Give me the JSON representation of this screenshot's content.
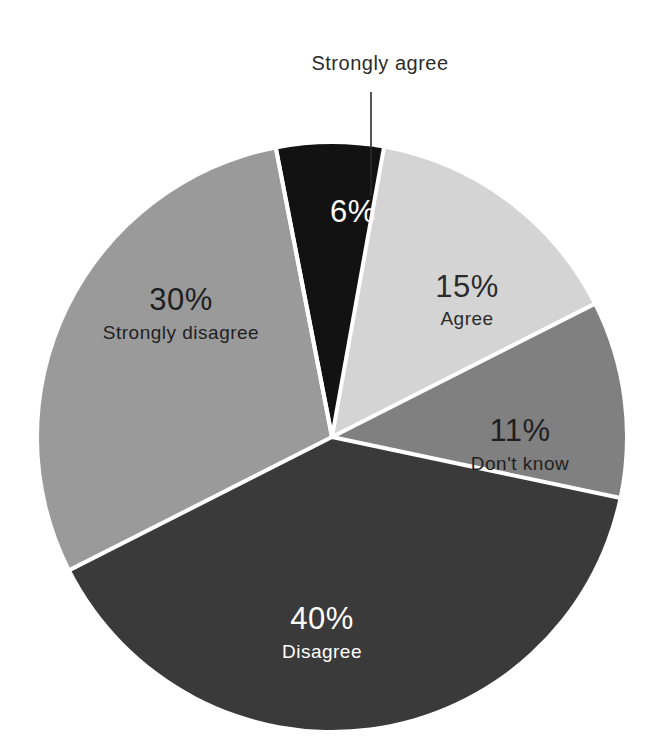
{
  "figure": {
    "background_color": "#ffffff",
    "separator_color": "#ffffff",
    "center_x": 332,
    "center_y": 437,
    "radius": 293
  },
  "external_label": {
    "text": "Strongly agree",
    "x": 380,
    "y": 70,
    "leader_from_x": 371,
    "leader_from_y": 92,
    "leader_to_x": 371,
    "leader_to_y": 196,
    "color": "#2b2b2b"
  },
  "chart_data": {
    "type": "pie",
    "title": "",
    "subtitle": "",
    "xlabel": "",
    "ylabel": "",
    "grid": false,
    "legend_position": "none",
    "units": "percent",
    "total": 102,
    "start_angle_deg": -11,
    "direction": "clockwise",
    "categories": [
      "Strongly agree",
      "Agree",
      "Don't know",
      "Disagree",
      "Strongly disagree"
    ],
    "values": [
      6,
      15,
      11,
      40,
      30
    ],
    "labels": [
      "6%",
      "15%",
      "11%",
      "40%",
      "30%"
    ],
    "colors": [
      "#121212",
      "#d4d4d4",
      "#808080",
      "#3a3a3a",
      "#9a9a9a"
    ],
    "text_colors": [
      "#ffffff",
      "#2b2b2b",
      "#1f1f1f",
      "#ffffff",
      "#1f1f1f"
    ],
    "label_placement": [
      "outside",
      "inside",
      "inside",
      "inside",
      "inside"
    ],
    "slices": [
      {
        "name": "Strongly agree",
        "value": 6,
        "label": "6%",
        "color": "#121212",
        "text_color": "#ffffff",
        "placement": "outside",
        "pct_x": 353,
        "pct_y": 222,
        "name_x": 0,
        "name_y": 0
      },
      {
        "name": "Agree",
        "value": 15,
        "label": "15%",
        "color": "#d4d4d4",
        "text_color": "#2b2b2b",
        "placement": "inside",
        "pct_x": 467,
        "pct_y": 297,
        "name_x": 467,
        "name_y": 325
      },
      {
        "name": "Don't know",
        "value": 11,
        "label": "11%",
        "color": "#808080",
        "text_color": "#1f1f1f",
        "placement": "inside",
        "pct_x": 520,
        "pct_y": 441,
        "name_x": 520,
        "name_y": 470
      },
      {
        "name": "Disagree",
        "value": 40,
        "label": "40%",
        "color": "#3a3a3a",
        "text_color": "#ffffff",
        "placement": "inside",
        "pct_x": 322,
        "pct_y": 629,
        "name_x": 322,
        "name_y": 658
      },
      {
        "name": "Strongly disagree",
        "value": 30,
        "label": "30%",
        "color": "#9a9a9a",
        "text_color": "#1f1f1f",
        "placement": "inside",
        "pct_x": 181,
        "pct_y": 310,
        "name_x": 181,
        "name_y": 339
      }
    ]
  }
}
